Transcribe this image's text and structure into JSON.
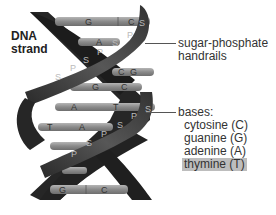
{
  "title": {
    "line1": "DNA",
    "line2": "strand"
  },
  "labels": {
    "sugar_phosphate": {
      "line1": "sugar-phosphate",
      "line2": "handrails"
    },
    "bases": {
      "heading": "bases:",
      "items": [
        {
          "label": "cytosine (C)",
          "highlighted": false
        },
        {
          "label": "guanine (G)",
          "highlighted": false
        },
        {
          "label": "adenine (A)",
          "highlighted": false
        },
        {
          "label": "thymine (T)",
          "highlighted": true
        }
      ]
    }
  },
  "helix": {
    "base_pairs": [
      {
        "left": "G",
        "right": "C"
      },
      {
        "left": "A",
        "right": "T"
      },
      {
        "left": "C",
        "right": "G"
      },
      {
        "left": "G",
        "right": "C"
      },
      {
        "left": "A",
        "right": "T"
      },
      {
        "left": "T",
        "right": "A"
      },
      {
        "left": "G",
        "right": "C"
      }
    ],
    "strand_letters": {
      "sugar": "S",
      "phosphate": "P"
    }
  },
  "colors": {
    "strand_dark": "#2a2a2a",
    "strand_mid": "#4a4a4a",
    "base_rung": "#8c8c8c",
    "highlight": "#bdbdbd"
  }
}
